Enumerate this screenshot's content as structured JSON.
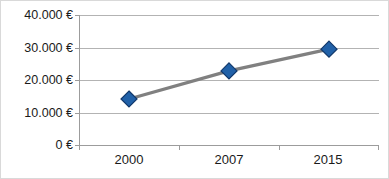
{
  "chart_data": {
    "type": "line",
    "title": "",
    "subtitle": "",
    "xlabel": "",
    "ylabel": "",
    "categories": [
      "2000",
      "2007",
      "2015"
    ],
    "values": [
      14150,
      22800,
      29500
    ],
    "series": [
      {
        "name": "",
        "values": [
          14150,
          22800,
          29500
        ]
      }
    ],
    "ytick_values": [
      0,
      10000,
      20000,
      30000,
      40000
    ],
    "ytick_labels": [
      "0 €",
      "10.000 €",
      "20.000 €",
      "30.000 €",
      "40.000 €"
    ],
    "ylim": [
      0,
      40000
    ],
    "grid": "horizontal",
    "legend": "none",
    "marker": "diamond",
    "colors": {
      "marker_fill": "#2161A8",
      "marker_edge": "#11386b",
      "line": "#808080",
      "gridline": "#b3b3b3",
      "axis": "#9c9c9c",
      "text": "#1a1a1a",
      "background": "#ffffff",
      "border": "#d9d9d9"
    }
  }
}
